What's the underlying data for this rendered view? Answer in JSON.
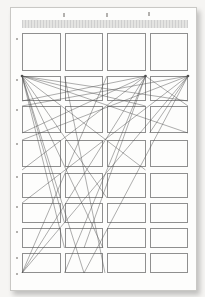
{
  "meta": {
    "stage": {
      "width": 205,
      "height": 297
    }
  },
  "colors": {
    "background": "#f6f5f3",
    "sheet": "#fdfdfc",
    "sheet_edge": "#c9c8c5",
    "band_dark": "#cfcfcf",
    "band_light": "#e4e4e2",
    "cell_edge": "#8f8f8f",
    "fan_line": "#4f4f4f",
    "tick": "#b3b1ae"
  },
  "sheet": {
    "left": 10,
    "top": 7,
    "width": 187,
    "height": 284
  },
  "diagram": {
    "header_band": {
      "left": 22,
      "top": 20,
      "width": 166,
      "height": 8
    },
    "grid": {
      "columns": 4,
      "rows_count": 8,
      "col_lefts": [
        22,
        64.5,
        107,
        149.5
      ],
      "col_width": 38.5,
      "rows": [
        {
          "top": 33,
          "height": 38
        },
        {
          "top": 76,
          "height": 25
        },
        {
          "top": 106,
          "height": 27
        },
        {
          "top": 140,
          "height": 27
        },
        {
          "top": 173,
          "height": 25
        },
        {
          "top": 203,
          "height": 20
        },
        {
          "top": 228,
          "height": 20
        },
        {
          "top": 253,
          "height": 20
        }
      ]
    },
    "fan_origins": [
      {
        "x": 22,
        "y": 76
      },
      {
        "x": 145.5,
        "y": 76
      },
      {
        "x": 188,
        "y": 76
      }
    ],
    "fan_lines": [
      [
        22,
        76,
        188,
        101
      ],
      [
        22,
        76,
        188,
        133
      ],
      [
        22,
        76,
        145.5,
        106
      ],
      [
        22,
        76,
        145.5,
        170
      ],
      [
        22,
        76,
        107,
        198
      ],
      [
        22,
        76,
        103,
        248
      ],
      [
        22,
        76,
        84,
        273
      ],
      [
        22,
        76,
        64.5,
        248
      ],
      [
        22,
        76,
        64.5,
        223
      ],
      [
        145.5,
        76,
        22,
        101
      ],
      [
        145.5,
        76,
        22,
        133
      ],
      [
        145.5,
        76,
        22,
        170
      ],
      [
        145.5,
        76,
        22,
        273
      ],
      [
        145.5,
        76,
        64.5,
        273
      ],
      [
        145.5,
        76,
        84,
        248
      ],
      [
        145.5,
        76,
        188,
        106
      ],
      [
        188,
        76,
        22,
        106
      ],
      [
        188,
        76,
        22,
        140
      ],
      [
        188,
        76,
        22,
        203
      ],
      [
        188,
        76,
        22,
        273
      ],
      [
        188,
        76,
        84,
        273
      ],
      [
        188,
        76,
        149.5,
        133
      ],
      [
        64.5,
        76,
        105,
        273
      ],
      [
        107,
        76,
        22,
        273
      ]
    ],
    "ticks": {
      "top": [
        {
          "x": 63,
          "y": 13,
          "w": 1.5,
          "h": 4
        },
        {
          "x": 106,
          "y": 13,
          "w": 1.5,
          "h": 4
        },
        {
          "x": 148,
          "y": 12,
          "w": 1.5,
          "h": 4
        }
      ],
      "left": [
        {
          "x": 16,
          "y": 38,
          "w": 2,
          "h": 2
        },
        {
          "x": 16,
          "y": 79,
          "w": 2,
          "h": 2
        },
        {
          "x": 16,
          "y": 109,
          "w": 2,
          "h": 2
        },
        {
          "x": 16,
          "y": 143,
          "w": 2,
          "h": 2
        },
        {
          "x": 16,
          "y": 176,
          "w": 2,
          "h": 2
        },
        {
          "x": 16,
          "y": 206,
          "w": 2,
          "h": 2
        },
        {
          "x": 16,
          "y": 231,
          "w": 2,
          "h": 2
        },
        {
          "x": 16,
          "y": 257,
          "w": 2,
          "h": 2
        },
        {
          "x": 16,
          "y": 273,
          "w": 2,
          "h": 2
        }
      ]
    }
  }
}
